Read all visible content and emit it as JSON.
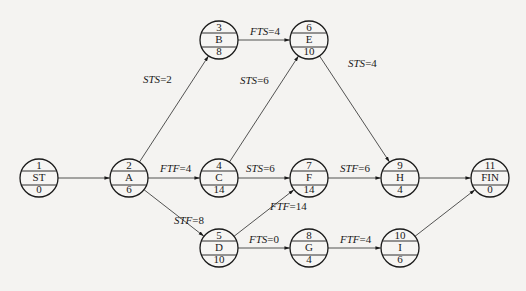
{
  "diagram": {
    "type": "precedence-network (single-code / activity-on-node with lags)",
    "node_radius": 19,
    "colors": {
      "line": "#1a1a1a",
      "background": "#f4f3f1"
    },
    "nodes": [
      {
        "id": "1",
        "name": "ST",
        "duration": "0",
        "x": 39,
        "y": 178
      },
      {
        "id": "2",
        "name": "A",
        "duration": "6",
        "x": 129,
        "y": 178
      },
      {
        "id": "3",
        "name": "B",
        "duration": "8",
        "x": 219,
        "y": 40
      },
      {
        "id": "4",
        "name": "C",
        "duration": "14",
        "x": 219,
        "y": 178
      },
      {
        "id": "5",
        "name": "D",
        "duration": "10",
        "x": 219,
        "y": 248
      },
      {
        "id": "6",
        "name": "E",
        "duration": "10",
        "x": 309,
        "y": 40
      },
      {
        "id": "7",
        "name": "F",
        "duration": "14",
        "x": 309,
        "y": 178
      },
      {
        "id": "8",
        "name": "G",
        "duration": "4",
        "x": 309,
        "y": 248
      },
      {
        "id": "9",
        "name": "H",
        "duration": "4",
        "x": 400,
        "y": 178
      },
      {
        "id": "10",
        "name": "I",
        "duration": "6",
        "x": 400,
        "y": 248
      },
      {
        "id": "11",
        "name": "FIN",
        "duration": "0",
        "x": 490,
        "y": 178
      }
    ],
    "edges": [
      {
        "from": "1",
        "to": "2",
        "type": "",
        "lag": "",
        "label_x": 0,
        "label_y": 0
      },
      {
        "from": "2",
        "to": "3",
        "type": "STS",
        "lag": "2",
        "label_x": 143,
        "label_y": 83
      },
      {
        "from": "2",
        "to": "4",
        "type": "FTF",
        "lag": "4",
        "label_x": 160,
        "label_y": 172
      },
      {
        "from": "2",
        "to": "5",
        "type": "STF",
        "lag": "8",
        "label_x": 174,
        "label_y": 224
      },
      {
        "from": "3",
        "to": "6",
        "type": "FTS",
        "lag": "4",
        "label_x": 250,
        "label_y": 35
      },
      {
        "from": "4",
        "to": "6",
        "type": "STS",
        "lag": "6",
        "label_x": 240,
        "label_y": 84
      },
      {
        "from": "4",
        "to": "7",
        "type": "STS",
        "lag": "6",
        "label_x": 246,
        "label_y": 172
      },
      {
        "from": "5",
        "to": "7",
        "type": "FTF",
        "lag": "14",
        "label_x": 270,
        "label_y": 210
      },
      {
        "from": "5",
        "to": "8",
        "type": "FTS",
        "lag": "0",
        "label_x": 249,
        "label_y": 243
      },
      {
        "from": "6",
        "to": "9",
        "type": "STS",
        "lag": "4",
        "label_x": 348,
        "label_y": 67
      },
      {
        "from": "7",
        "to": "9",
        "type": "STF",
        "lag": "6",
        "label_x": 340,
        "label_y": 172
      },
      {
        "from": "8",
        "to": "10",
        "type": "FTF",
        "lag": "4",
        "label_x": 340,
        "label_y": 243
      },
      {
        "from": "9",
        "to": "11",
        "type": "",
        "lag": "",
        "label_x": 0,
        "label_y": 0
      },
      {
        "from": "10",
        "to": "11",
        "type": "",
        "lag": "",
        "label_x": 0,
        "label_y": 0
      }
    ]
  }
}
